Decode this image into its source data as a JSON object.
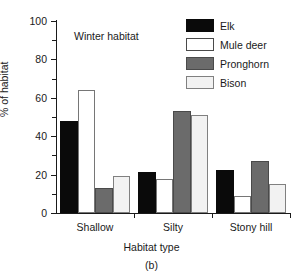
{
  "chart_data": {
    "type": "bar",
    "title": "Winter habitat",
    "caption": "(b)",
    "xlabel": "Habitat type",
    "ylabel": "% of habitat",
    "categories": [
      "Shallow",
      "Silty",
      "Stony hill"
    ],
    "series": [
      {
        "name": "Elk",
        "color": "#0a0a0a",
        "values": [
          48,
          21.5,
          22.5
        ]
      },
      {
        "name": "Mule deer",
        "color": "#ffffff",
        "values": [
          64,
          17.5,
          9
        ]
      },
      {
        "name": "Pronghorn",
        "color": "#6b6b6b",
        "values": [
          13,
          53,
          27
        ]
      },
      {
        "name": "Bison",
        "color": "#f2f2f2",
        "values": [
          19.5,
          51,
          15
        ]
      }
    ],
    "ylim": [
      0,
      100
    ],
    "ytick_labels": [
      "0",
      "20",
      "40",
      "60",
      "80",
      "100"
    ],
    "ytick_values": [
      0,
      20,
      40,
      60,
      80,
      100
    ],
    "yminor_values": [
      10,
      30,
      50,
      70,
      90
    ],
    "grid": false,
    "legend_position": "top-right"
  }
}
